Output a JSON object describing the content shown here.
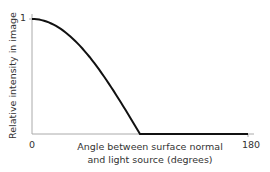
{
  "chart_data": {
    "type": "line",
    "title": "",
    "xlabel": "Angle between surface normal and light source (degrees)",
    "xlabel_line1": "Angle between surface normal",
    "xlabel_line2": "and light source (degrees)",
    "ylabel": "Relative intensity in image",
    "xlim": [
      0,
      180
    ],
    "ylim": [
      0,
      1
    ],
    "xticks": [
      "0",
      "180"
    ],
    "yticks": [
      "1"
    ],
    "grid": false,
    "series": [
      {
        "name": "intensity",
        "x": [
          0,
          10,
          20,
          30,
          40,
          50,
          60,
          70,
          80,
          90,
          120,
          150,
          180
        ],
        "y": [
          1,
          0.985,
          0.94,
          0.866,
          0.766,
          0.643,
          0.5,
          0.342,
          0.174,
          0,
          0,
          0,
          0
        ]
      }
    ],
    "colors": {
      "line": "#111111",
      "axis": "#999999"
    }
  }
}
